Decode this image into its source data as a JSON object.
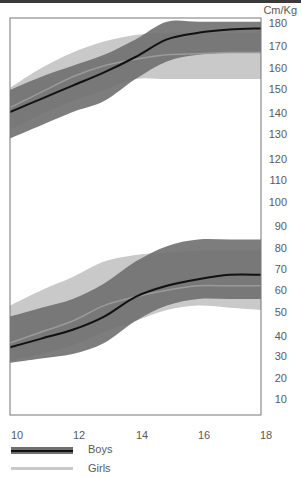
{
  "chart_data": {
    "type": "area",
    "title": "",
    "unit_label": "Cm/Kg",
    "xlabel": "Age (years)",
    "ylabel": "Cm / Kg",
    "xlim": [
      10,
      18
    ],
    "ylim": [
      0,
      184
    ],
    "x_ticks": [
      10,
      12,
      14,
      16,
      18
    ],
    "y_ticks": [
      10,
      20,
      30,
      40,
      50,
      60,
      70,
      80,
      90,
      100,
      110,
      120,
      130,
      140,
      150,
      160,
      170,
      180
    ],
    "grid": false,
    "legend_position": "bottom-left",
    "x": [
      10,
      11,
      12,
      13,
      14,
      15,
      16,
      17,
      18
    ],
    "series": [
      {
        "name": "Boys height median",
        "group": "Boys",
        "measure": "height",
        "values": [
          140,
          146,
          152,
          158,
          165,
          173,
          176,
          177.5,
          178
        ]
      },
      {
        "name": "Boys height lower",
        "group": "Boys",
        "measure": "height",
        "values": [
          128,
          134,
          140,
          145,
          155,
          163,
          166,
          167,
          167
        ]
      },
      {
        "name": "Boys height upper",
        "group": "Boys",
        "measure": "height",
        "values": [
          150,
          156,
          161,
          166,
          173,
          181,
          181,
          181,
          181
        ]
      },
      {
        "name": "Girls height median",
        "group": "Girls",
        "measure": "height",
        "values": [
          142,
          149,
          156,
          161,
          164,
          166,
          166.5,
          167,
          167
        ]
      },
      {
        "name": "Girls height lower",
        "group": "Girls",
        "measure": "height",
        "values": [
          132,
          139,
          145,
          150,
          155,
          155,
          155,
          155,
          155
        ]
      },
      {
        "name": "Girls height upper",
        "group": "Girls",
        "measure": "height",
        "values": [
          151,
          160,
          167,
          172,
          175,
          176,
          176,
          176,
          176
        ]
      },
      {
        "name": "Boys weight median",
        "group": "Boys",
        "measure": "weight",
        "values": [
          33,
          37,
          41,
          47,
          56,
          61,
          64,
          66,
          66
        ]
      },
      {
        "name": "Boys weight lower",
        "group": "Boys",
        "measure": "weight",
        "values": [
          26,
          28,
          30,
          35,
          45,
          52,
          55,
          55,
          55
        ]
      },
      {
        "name": "Boys weight upper",
        "group": "Boys",
        "measure": "weight",
        "values": [
          47,
          51,
          55,
          62,
          72,
          79,
          82,
          82,
          82
        ]
      },
      {
        "name": "Girls weight median",
        "group": "Girls",
        "measure": "weight",
        "values": [
          35,
          40,
          45,
          52,
          56,
          59,
          61,
          61,
          61
        ]
      },
      {
        "name": "Girls weight lower",
        "group": "Girls",
        "measure": "weight",
        "values": [
          27,
          30,
          34,
          40,
          45,
          50,
          52,
          51,
          50
        ]
      },
      {
        "name": "Girls weight upper",
        "group": "Girls",
        "measure": "weight",
        "values": [
          52,
          59,
          65,
          72,
          75,
          76,
          77,
          77,
          77
        ]
      }
    ],
    "legend": [
      {
        "label": "Boys",
        "band_color": "#6f6f6f",
        "line_color": "#111111"
      },
      {
        "label": "Girls",
        "band_color": "#c9c9c9",
        "line_color": "#9a9a9a"
      }
    ]
  },
  "labels": {
    "unit": "Cm/Kg",
    "x_ticks": [
      "10",
      "12",
      "14",
      "16",
      "18"
    ],
    "y_ticks": [
      "180",
      "170",
      "160",
      "150",
      "140",
      "130",
      "120",
      "110",
      "100",
      "90",
      "80",
      "70",
      "60",
      "50",
      "40",
      "30",
      "20",
      "10"
    ],
    "legend_boys": "Boys",
    "legend_girls": "Girls"
  },
  "colors": {
    "boys_band": "#6f6f6f",
    "boys_line": "#111111",
    "girls_band": "#c9c9c9",
    "girls_line": "#9a9a9a",
    "frame": "#777777"
  }
}
